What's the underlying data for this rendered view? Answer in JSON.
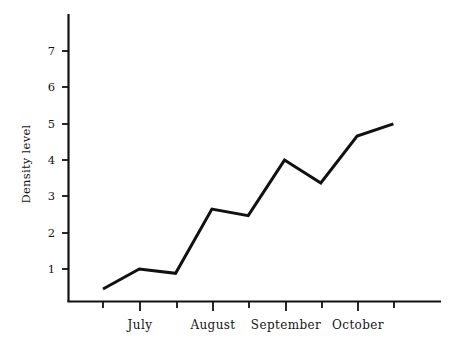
{
  "chart_data": {
    "type": "line",
    "title": "",
    "subtitle": "",
    "xlabel": "",
    "ylabel": "Density level",
    "ylim": [
      0,
      7.7
    ],
    "xlim": [
      0,
      10
    ],
    "grid": false,
    "legend": null,
    "legend_position": "none",
    "line_color": "#111111",
    "line_width": 3,
    "marker": "none",
    "y_ticks": [
      1,
      2,
      3,
      4,
      5,
      6,
      7
    ],
    "y_tick_labels": [
      "1",
      "2",
      "3",
      "4",
      "5",
      "6",
      "7"
    ],
    "x_tick_labels": [
      "July",
      "August",
      "September",
      "October"
    ],
    "x_major_tick_indices": [
      1,
      3,
      5,
      7
    ],
    "x_minor_tick_count": 9,
    "x": [
      1,
      2,
      3,
      4,
      5,
      6,
      7,
      8,
      9
    ],
    "values": [
      0.45,
      1.0,
      0.88,
      2.65,
      2.47,
      4.0,
      3.37,
      4.66,
      5.0
    ],
    "series": [
      {
        "name": "Density level",
        "values": [
          0.45,
          1.0,
          0.88,
          2.65,
          2.47,
          4.0,
          3.37,
          4.66,
          5.0
        ]
      }
    ],
    "points": [
      {
        "x": 1,
        "y": 0.45
      },
      {
        "x": 2,
        "y": 1.0
      },
      {
        "x": 3,
        "y": 0.88
      },
      {
        "x": 4,
        "y": 2.65
      },
      {
        "x": 5,
        "y": 2.47
      },
      {
        "x": 6,
        "y": 4.0
      },
      {
        "x": 7,
        "y": 3.37
      },
      {
        "x": 8,
        "y": 4.66
      },
      {
        "x": 9,
        "y": 5.0
      }
    ]
  },
  "axes": {
    "y_label": "Density level",
    "y_tick_1": "1",
    "y_tick_2": "2",
    "y_tick_3": "3",
    "y_tick_4": "4",
    "y_tick_5": "5",
    "y_tick_6": "6",
    "y_tick_7": "7",
    "x_label_july": "July",
    "x_label_august": "August",
    "x_label_september": "September",
    "x_label_october": "October"
  },
  "colors": {
    "background": "#ffffff",
    "axis": "#111111",
    "line": "#111111",
    "text": "#141414"
  }
}
